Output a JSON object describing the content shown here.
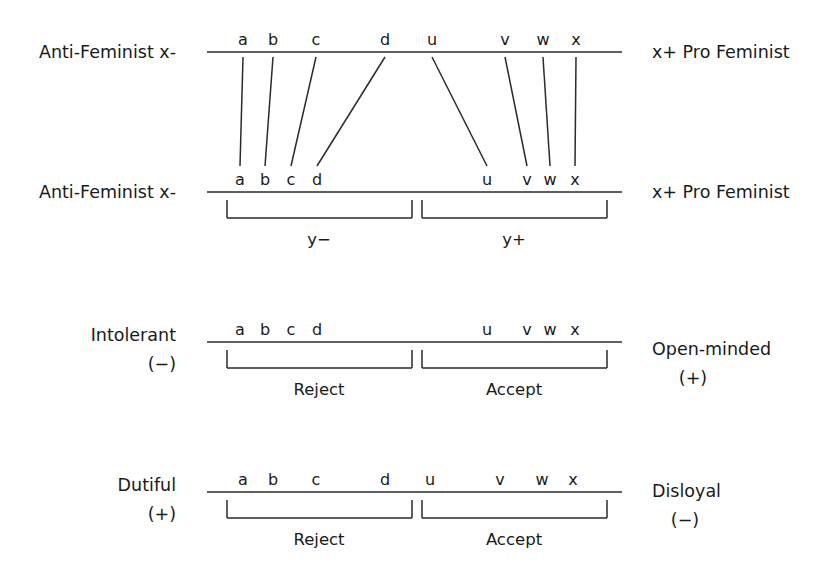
{
  "figure": {
    "title": "",
    "background_color": "#ffffff",
    "line_color": "#2b2b2b",
    "text_color": "#1a1a1a"
  },
  "rows": [
    {
      "id": "row-1-attitude-scale-top",
      "left_label": "Anti-Feminist x-",
      "right_label": "x+ Pro Feminist",
      "left_label_lines": [
        "Anti-Feminist x-"
      ],
      "right_label_lines": [
        "x+ Pro Feminist"
      ],
      "items": [
        {
          "letter": "a",
          "x": 243
        },
        {
          "letter": "b",
          "x": 273
        },
        {
          "letter": "c",
          "x": 316
        },
        {
          "letter": "d",
          "x": 385
        },
        {
          "letter": "u",
          "x": 432
        },
        {
          "letter": "v",
          "x": 505
        },
        {
          "letter": "w",
          "x": 543
        },
        {
          "letter": "x",
          "x": 576
        }
      ],
      "brackets": []
    },
    {
      "id": "row-2-latitude-scale",
      "left_label": "Anti-Feminist x-",
      "right_label": "x+ Pro Feminist",
      "left_label_lines": [
        "Anti-Feminist x-"
      ],
      "right_label_lines": [
        "x+ Pro Feminist"
      ],
      "items": [
        {
          "letter": "a",
          "x": 240
        },
        {
          "letter": "b",
          "x": 265
        },
        {
          "letter": "c",
          "x": 291
        },
        {
          "letter": "d",
          "x": 317
        },
        {
          "letter": "u",
          "x": 487
        },
        {
          "letter": "v",
          "x": 527
        },
        {
          "letter": "w",
          "x": 550
        },
        {
          "letter": "x",
          "x": 575
        }
      ],
      "brackets": [
        {
          "label": "y−",
          "x_start": 227,
          "x_end": 412
        },
        {
          "label": "y+",
          "x_start": 422,
          "x_end": 607
        }
      ]
    },
    {
      "id": "row-3-tolerance-scale",
      "left_label": "Intolerant (−)",
      "right_label": "Open-minded (+)",
      "left_label_lines": [
        "Intolerant",
        "(−)"
      ],
      "right_label_lines": [
        "Open-minded",
        "(+)"
      ],
      "items": [
        {
          "letter": "a",
          "x": 240
        },
        {
          "letter": "b",
          "x": 265
        },
        {
          "letter": "c",
          "x": 291
        },
        {
          "letter": "d",
          "x": 317
        },
        {
          "letter": "u",
          "x": 487
        },
        {
          "letter": "v",
          "x": 527
        },
        {
          "letter": "w",
          "x": 550
        },
        {
          "letter": "x",
          "x": 575
        }
      ],
      "brackets": [
        {
          "label": "Reject",
          "x_start": 227,
          "x_end": 412
        },
        {
          "label": "Accept",
          "x_start": 422,
          "x_end": 607
        }
      ]
    },
    {
      "id": "row-4-loyalty-scale",
      "left_label": "Dutiful (+)",
      "right_label": "Disloyal (−)",
      "left_label_lines": [
        "Dutiful",
        "(+)"
      ],
      "right_label_lines": [
        "Disloyal",
        "(−)"
      ],
      "items": [
        {
          "letter": "a",
          "x": 243
        },
        {
          "letter": "b",
          "x": 273
        },
        {
          "letter": "c",
          "x": 316
        },
        {
          "letter": "d",
          "x": 385
        },
        {
          "letter": "u",
          "x": 430
        },
        {
          "letter": "v",
          "x": 500
        },
        {
          "letter": "w",
          "x": 542
        },
        {
          "letter": "x",
          "x": 573
        }
      ],
      "brackets": [
        {
          "label": "Reject",
          "x_start": 227,
          "x_end": 412
        },
        {
          "label": "Accept",
          "x_start": 422,
          "x_end": 607
        }
      ]
    }
  ],
  "connectors": [
    {
      "letter": "a",
      "x_top": 243,
      "x_bottom": 240
    },
    {
      "letter": "b",
      "x_top": 273,
      "x_bottom": 265
    },
    {
      "letter": "c",
      "x_top": 316,
      "x_bottom": 291
    },
    {
      "letter": "d",
      "x_top": 385,
      "x_bottom": 317
    },
    {
      "letter": "u",
      "x_top": 432,
      "x_bottom": 487
    },
    {
      "letter": "v",
      "x_top": 505,
      "x_bottom": 527
    },
    {
      "letter": "w",
      "x_top": 543,
      "x_bottom": 550
    },
    {
      "letter": "x",
      "x_top": 576,
      "x_bottom": 575
    }
  ],
  "geometry": {
    "axis_x_start": 207,
    "axis_x_end": 622,
    "row_axis_y": [
      52,
      192,
      342,
      492
    ],
    "letter_baseline_offset": -6,
    "bracket_top_offset": 8,
    "bracket_depth": 18,
    "bracket_label_offset": 45,
    "left_label_x": 176,
    "right_label_x": 652
  }
}
